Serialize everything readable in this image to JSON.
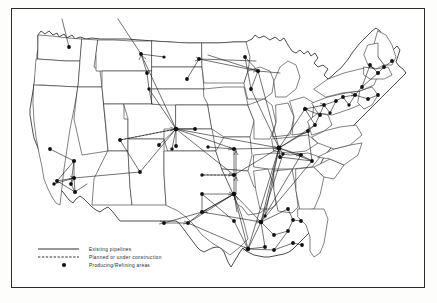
{
  "figure": {
    "background_color": "#ffffff",
    "ink_color": "#1a1a1a",
    "border_color": "#2b2b2b"
  },
  "legend": {
    "items": [
      {
        "symbol": "solid-line",
        "label": "Existing pipelines"
      },
      {
        "symbol": "dashed-line",
        "label": "Planned or under construction"
      },
      {
        "symbol": "filled-dot",
        "label": "Producing/Refining areas"
      }
    ]
  },
  "map_data": {
    "type": "network-map",
    "region": "Contiguous United States",
    "node_symbol": "filled circle",
    "node_count": 86,
    "clusters": [
      {
        "name": "Pacific Northwest",
        "nodes": 3
      },
      {
        "name": "California",
        "nodes": 8
      },
      {
        "name": "Rocky Mountain / Wyoming hub",
        "nodes": 9
      },
      {
        "name": "Northern Plains",
        "nodes": 6
      },
      {
        "name": "Kansas / Oklahoma corridor",
        "nodes": 10
      },
      {
        "name": "Texas / Gulf Coast",
        "nodes": 16
      },
      {
        "name": "Midwest / Great Lakes",
        "nodes": 14
      },
      {
        "name": "Northeast / Atlantic Seaboard",
        "nodes": 12
      },
      {
        "name": "Southeast",
        "nodes": 8
      }
    ],
    "nodes": [
      [
        57,
        38
      ],
      [
        129,
        45
      ],
      [
        135,
        64
      ],
      [
        187,
        50
      ],
      [
        175,
        70
      ],
      [
        233,
        48
      ],
      [
        246,
        62
      ],
      [
        239,
        80
      ],
      [
        164,
        120
      ],
      [
        164,
        137
      ],
      [
        183,
        120
      ],
      [
        160,
        140
      ],
      [
        147,
        136
      ],
      [
        38,
        140
      ],
      [
        62,
        152
      ],
      [
        45,
        172
      ],
      [
        59,
        175
      ],
      [
        62,
        169
      ],
      [
        42,
        175
      ],
      [
        63,
        183
      ],
      [
        128,
        163
      ],
      [
        222,
        140
      ],
      [
        267,
        139
      ],
      [
        222,
        166
      ],
      [
        222,
        185
      ],
      [
        225,
        203
      ],
      [
        218,
        212
      ],
      [
        190,
        185
      ],
      [
        152,
        214
      ],
      [
        176,
        214
      ],
      [
        190,
        203
      ],
      [
        236,
        213
      ],
      [
        249,
        240
      ],
      [
        253,
        238
      ],
      [
        262,
        226
      ],
      [
        264,
        241
      ],
      [
        281,
        234
      ],
      [
        290,
        236
      ],
      [
        279,
        243
      ],
      [
        248,
        210
      ],
      [
        253,
        207
      ],
      [
        262,
        209
      ],
      [
        245,
        196
      ],
      [
        276,
        200
      ],
      [
        281,
        211
      ],
      [
        289,
        212
      ],
      [
        276,
        222
      ],
      [
        268,
        148
      ],
      [
        271,
        145
      ],
      [
        289,
        146
      ],
      [
        300,
        152
      ],
      [
        296,
        122
      ],
      [
        303,
        116
      ],
      [
        308,
        106
      ],
      [
        293,
        100
      ],
      [
        312,
        96
      ],
      [
        318,
        104
      ],
      [
        324,
        92
      ],
      [
        331,
        88
      ],
      [
        337,
        96
      ],
      [
        343,
        86
      ],
      [
        350,
        78
      ],
      [
        356,
        90
      ],
      [
        340,
        68
      ],
      [
        347,
        62
      ],
      [
        358,
        56
      ],
      [
        366,
        64
      ],
      [
        372,
        58
      ],
      [
        380,
        52
      ],
      [
        385,
        60
      ],
      [
        390,
        70
      ],
      [
        378,
        78
      ],
      [
        372,
        88
      ],
      [
        366,
        98
      ],
      [
        355,
        104
      ],
      [
        349,
        112
      ],
      [
        341,
        120
      ],
      [
        330,
        128
      ],
      [
        320,
        134
      ],
      [
        313,
        142
      ],
      [
        306,
        158
      ],
      [
        300,
        168
      ],
      [
        292,
        176
      ],
      [
        286,
        186
      ],
      [
        300,
        190
      ],
      [
        310,
        196
      ]
    ],
    "hubs": [
      {
        "name": "Wyoming hub",
        "x": 164,
        "y": 120
      },
      {
        "name": "Chicago hub",
        "x": 267,
        "y": 139
      },
      {
        "name": "Oklahoma hub",
        "x": 222,
        "y": 185
      },
      {
        "name": "Gulf Coast hub",
        "x": 249,
        "y": 213
      },
      {
        "name": "Houston hub",
        "x": 236,
        "y": 240
      }
    ],
    "axis_notes": {
      "grid": false,
      "legend_position": "bottom-left"
    }
  }
}
